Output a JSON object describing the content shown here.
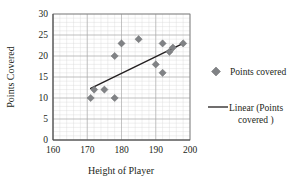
{
  "chart_data": {
    "type": "scatter",
    "title": "",
    "xlabel": "Height of Player",
    "ylabel": "Points Covered",
    "xlim": [
      160,
      200
    ],
    "ylim": [
      0,
      30
    ],
    "xticks": [
      160,
      170,
      180,
      190,
      200
    ],
    "yticks": [
      0,
      5,
      10,
      15,
      20,
      25,
      30
    ],
    "x_major_step": 10,
    "y_major_step": 5,
    "x_minor_step": 2,
    "y_minor_step": 1,
    "grid": true,
    "grid_minor": true,
    "legend_position": "right",
    "marker": "diamond",
    "marker_color": "#808285",
    "trendline_color": "#231f20",
    "series": [
      {
        "name": "Points covered",
        "type": "scatter",
        "points": [
          {
            "x": 171,
            "y": 10
          },
          {
            "x": 172,
            "y": 12
          },
          {
            "x": 175,
            "y": 12
          },
          {
            "x": 178,
            "y": 10
          },
          {
            "x": 178,
            "y": 20
          },
          {
            "x": 180,
            "y": 23
          },
          {
            "x": 185,
            "y": 24
          },
          {
            "x": 190,
            "y": 18
          },
          {
            "x": 192,
            "y": 23
          },
          {
            "x": 192,
            "y": 16
          },
          {
            "x": 194,
            "y": 21
          },
          {
            "x": 195,
            "y": 22
          },
          {
            "x": 198,
            "y": 23
          }
        ]
      },
      {
        "name": "Linear (Points covered )",
        "type": "line",
        "points": [
          {
            "x": 171,
            "y": 12.3
          },
          {
            "x": 198,
            "y": 23.0
          }
        ]
      }
    ]
  },
  "axes": {
    "x_title": "Height of Player",
    "y_title": "Points Covered",
    "x_tick_labels": [
      "160",
      "170",
      "180",
      "190",
      "200"
    ],
    "y_tick_labels": [
      "0",
      "5",
      "10",
      "15",
      "20",
      "25",
      "30"
    ]
  },
  "legend": {
    "entries": [
      {
        "label": "Points covered",
        "marker": "diamond-marker",
        "color": "#808285"
      },
      {
        "label_line1": "Linear (Points",
        "label_line2": "covered )",
        "marker": "line-marker",
        "color": "#231f20"
      }
    ]
  }
}
